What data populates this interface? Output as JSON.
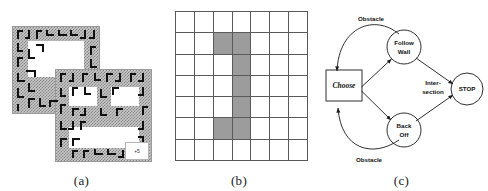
{
  "figure": {
    "panels": [
      {
        "id": "a",
        "caption": "(a)",
        "kind": "maze-map"
      },
      {
        "id": "b",
        "caption": "(b)",
        "kind": "occupancy-grid"
      },
      {
        "id": "c",
        "caption": "(c)",
        "kind": "state-diagram"
      }
    ]
  },
  "panel_a": {
    "caption": "(a)",
    "badge_label": "+5",
    "rings": [
      {
        "name": "upper-left-ring",
        "x": 0,
        "y": 0,
        "w": 88,
        "h": 88,
        "hole": {
          "x": 16,
          "y": 15,
          "w": 56,
          "h": 36
        }
      },
      {
        "name": "lower-right-ring",
        "x": 43,
        "y": 43,
        "w": 97,
        "h": 93,
        "hole_a": {
          "x": 14,
          "y": 18,
          "w": 30,
          "h": 20
        },
        "hole_b": {
          "x": 56,
          "y": 18,
          "w": 30,
          "h": 20
        },
        "hole_c": {
          "x": 14,
          "y": 58,
          "w": 72,
          "h": 22
        }
      }
    ]
  },
  "panel_b": {
    "caption": "(b)",
    "columns": 7,
    "rows": 7,
    "shaded_cells": [
      {
        "row": 1,
        "col": 2
      },
      {
        "row": 1,
        "col": 3
      },
      {
        "row": 2,
        "col": 3
      },
      {
        "row": 3,
        "col": 3
      },
      {
        "row": 4,
        "col": 3
      },
      {
        "row": 5,
        "col": 2
      },
      {
        "row": 5,
        "col": 3
      }
    ],
    "cell_fill_color": "#9c9c9c",
    "grid_line_color": "#5a5a5a"
  },
  "panel_c": {
    "caption": "(c)",
    "nodes": [
      {
        "id": "choose",
        "label": "Choose",
        "shape": "rect",
        "style": "italic"
      },
      {
        "id": "follow-wall",
        "label_line1": "Follow",
        "label_line2": "Wall",
        "shape": "circle"
      },
      {
        "id": "back-off",
        "label_line1": "Back",
        "label_line2": "Off",
        "shape": "circle"
      },
      {
        "id": "stop",
        "label": "STOP",
        "shape": "circle"
      }
    ],
    "edge_labels": [
      {
        "id": "obstacle-top",
        "text": "Obstacle"
      },
      {
        "id": "obstacle-bottom",
        "text": "Obstacle"
      },
      {
        "id": "intersection",
        "line1": "Inter-",
        "line2": "section"
      }
    ]
  }
}
